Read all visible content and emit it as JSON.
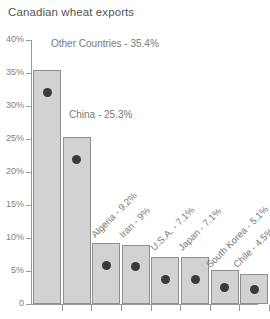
{
  "chart_data": {
    "type": "bar",
    "title": "Canadian wheat exports",
    "xlabel": "",
    "ylabel": "",
    "ylim": [
      0,
      40
    ],
    "grid": false,
    "legend": "none",
    "ytick_labels": [
      "40%",
      "35%",
      "30%",
      "25%",
      "20%",
      "15%",
      "10%",
      "5%",
      "0"
    ],
    "ytick_values": [
      40,
      35,
      30,
      25,
      20,
      15,
      10,
      5,
      0
    ],
    "categories": [
      "Other Countries",
      "China",
      "Algeria",
      "Iran",
      "U.S.A.",
      "Japan",
      "South Korea",
      "Chile"
    ],
    "values": [
      35.4,
      25.3,
      9.2,
      9.0,
      7.1,
      7.1,
      5.1,
      4.5
    ],
    "annotations": [
      "Other Countries - 35.4%",
      "China - 25.3%",
      "Algeria - 9.2%",
      "Iran - 9%",
      "U.S.A. - 7.1%",
      "Japan - 7.1%",
      "South Korea - 5.1%",
      "Chile - 4.5%"
    ],
    "bar_fill_color": "#d2d2d2",
    "bar_border_color": "#8f8f8f",
    "marker_color": "#3a3a3a",
    "axis_color": "#9a9a9a",
    "text_color": "#777777"
  }
}
